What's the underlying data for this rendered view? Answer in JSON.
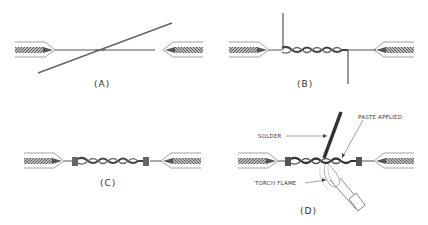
{
  "figure": {
    "panels": [
      {
        "id": "A",
        "label": "(A)",
        "description": "Two stripped wire ends crossed"
      },
      {
        "id": "B",
        "label": "(B)",
        "description": "Wires twisted together with ends bent perpendicular"
      },
      {
        "id": "C",
        "label": "(C)",
        "description": "Twisted splice with ends wrapped tight"
      },
      {
        "id": "D",
        "label": "(D)",
        "description": "Soldering the splice"
      }
    ],
    "callouts": {
      "solder": "SOLDER",
      "paste_applied": "PASTE APPLIED",
      "torch_flame": "TORCH FLAME"
    },
    "colors": {
      "line": "#555555",
      "insulation_fill": "#888888",
      "background": "#ffffff"
    }
  }
}
